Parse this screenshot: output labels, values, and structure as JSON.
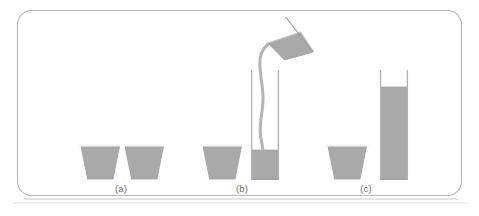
{
  "figure": {
    "width": 479,
    "height": 216,
    "background_color": "#ffffff",
    "frame": {
      "stroke_color": "#b5b5b5",
      "stroke_width": 1.1,
      "corner_radius": 14,
      "x": 17,
      "y": 10,
      "width": 445,
      "height": 186,
      "shadow_color": "#d8d8d8"
    },
    "liquid_color": "#a9a9a9",
    "liquid_edge_color": "#9a9a9a",
    "glass_outline_color": "#b0b0b0",
    "vessel_rim_color": "#f2f2f2"
  },
  "panels": [
    {
      "id": "panel-a",
      "label": "(a)",
      "label_x": 121,
      "label_y": 185,
      "description": "Two identical short beakers with equal amounts of liquid",
      "vessels": [
        {
          "name": "cup-a-left",
          "type": "tapered-cup",
          "top_width": 40,
          "bottom_width": 27,
          "top_y": 146,
          "bottom_y": 179,
          "center_x": 100,
          "fill_level": 1.0
        },
        {
          "name": "cup-a-right",
          "type": "tapered-cup",
          "top_width": 40,
          "bottom_width": 27,
          "top_y": 146,
          "bottom_y": 179,
          "center_x": 144,
          "fill_level": 1.0
        }
      ]
    },
    {
      "id": "panel-b",
      "label": "(b)",
      "label_x": 242,
      "label_y": 185,
      "description": "Liquid from one beaker is being poured into a tall narrow cylinder",
      "vessels": [
        {
          "name": "cup-b-left",
          "type": "tapered-cup",
          "top_width": 40,
          "bottom_width": 27,
          "top_y": 146,
          "bottom_y": 179,
          "center_x": 222,
          "fill_level": 1.0
        },
        {
          "name": "cylinder-b",
          "type": "tall-cylinder",
          "left_x": 251,
          "right_x": 278,
          "top_y": 70,
          "bottom_y": 179,
          "fill_top_y": 150
        },
        {
          "name": "pouring-beaker",
          "type": "tilted-pouring-vessel",
          "tilt_degrees": -28,
          "spout_x": 267,
          "spout_y": 45
        },
        {
          "name": "liquid-stream",
          "type": "stream",
          "from_x": 267,
          "from_y": 45,
          "to_x": 264,
          "to_y": 150
        }
      ]
    },
    {
      "id": "panel-c",
      "label": "(c)",
      "label_x": 366,
      "label_y": 185,
      "description": "One beaker and a tall cylinder holding the same amount of liquid at a higher level",
      "vessels": [
        {
          "name": "cup-c-left",
          "type": "tapered-cup",
          "top_width": 40,
          "bottom_width": 27,
          "top_y": 146,
          "bottom_y": 179,
          "center_x": 347,
          "fill_level": 1.0
        },
        {
          "name": "cylinder-c",
          "type": "tall-cylinder",
          "left_x": 380,
          "right_x": 407,
          "top_y": 70,
          "bottom_y": 179,
          "fill_top_y": 87
        }
      ]
    }
  ]
}
